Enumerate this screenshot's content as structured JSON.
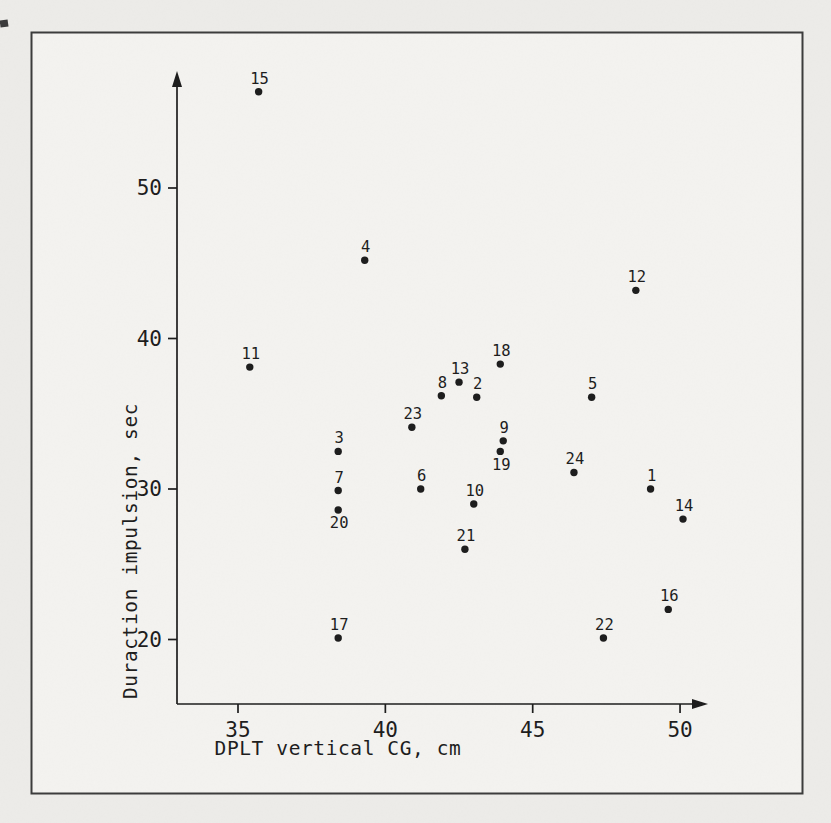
{
  "figure": {
    "kind": "scanned scatter-plot figure",
    "page_background": "#edece9",
    "frame_fill": "#f4f3f0",
    "frame_stroke": "#3b3b3b",
    "ink_color": "#1c1c1c"
  },
  "chart_data": {
    "type": "scatter",
    "title": "",
    "xlabel": "DPLT vertical CG, cm",
    "ylabel": "Duraction impulsion, sec",
    "x_ticks": [
      35,
      40,
      45,
      50
    ],
    "y_ticks": [
      20,
      30,
      40,
      50
    ],
    "xlim": [
      33,
      51.5
    ],
    "ylim": [
      16,
      58.5
    ],
    "grid": false,
    "legend": "none",
    "marker": "filled-circle",
    "points": [
      {
        "label": "1",
        "x": 49.0,
        "y": 30.0,
        "label_pos": "above"
      },
      {
        "label": "2",
        "x": 43.1,
        "y": 36.1,
        "label_pos": "above"
      },
      {
        "label": "3",
        "x": 38.4,
        "y": 32.5,
        "label_pos": "above"
      },
      {
        "label": "4",
        "x": 39.3,
        "y": 45.2,
        "label_pos": "above"
      },
      {
        "label": "5",
        "x": 47.0,
        "y": 36.1,
        "label_pos": "above"
      },
      {
        "label": "6",
        "x": 41.2,
        "y": 30.0,
        "label_pos": "above"
      },
      {
        "label": "7",
        "x": 38.4,
        "y": 29.9,
        "label_pos": "above"
      },
      {
        "label": "8",
        "x": 41.9,
        "y": 36.2,
        "label_pos": "above"
      },
      {
        "label": "9",
        "x": 44.0,
        "y": 33.2,
        "label_pos": "above"
      },
      {
        "label": "10",
        "x": 43.0,
        "y": 29.0,
        "label_pos": "above"
      },
      {
        "label": "11",
        "x": 35.4,
        "y": 38.1,
        "label_pos": "above"
      },
      {
        "label": "12",
        "x": 48.5,
        "y": 43.2,
        "label_pos": "above"
      },
      {
        "label": "13",
        "x": 42.5,
        "y": 37.1,
        "label_pos": "above"
      },
      {
        "label": "14",
        "x": 50.1,
        "y": 28.0,
        "label_pos": "above"
      },
      {
        "label": "15",
        "x": 35.7,
        "y": 56.4,
        "label_pos": "above"
      },
      {
        "label": "16",
        "x": 49.6,
        "y": 22.0,
        "label_pos": "above"
      },
      {
        "label": "17",
        "x": 38.4,
        "y": 20.1,
        "label_pos": "above"
      },
      {
        "label": "18",
        "x": 43.9,
        "y": 38.3,
        "label_pos": "above"
      },
      {
        "label": "19",
        "x": 43.9,
        "y": 32.5,
        "label_pos": "below"
      },
      {
        "label": "20",
        "x": 38.4,
        "y": 28.6,
        "label_pos": "below"
      },
      {
        "label": "21",
        "x": 42.7,
        "y": 26.0,
        "label_pos": "above"
      },
      {
        "label": "22",
        "x": 47.4,
        "y": 20.1,
        "label_pos": "above"
      },
      {
        "label": "23",
        "x": 40.9,
        "y": 34.1,
        "label_pos": "above"
      },
      {
        "label": "24",
        "x": 46.4,
        "y": 31.1,
        "label_pos": "above"
      }
    ]
  }
}
